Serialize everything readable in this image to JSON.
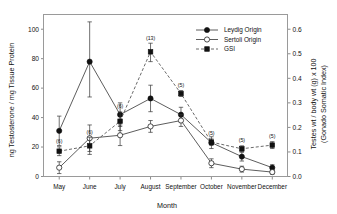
{
  "chart_data": {
    "type": "line",
    "title": "",
    "xlabel": "Month",
    "ylabel": "ng Testosterone / mg Tissue Protein",
    "y2label_line1": "Testes wt / body wt (g) x 100",
    "y2label_line2": "(Gonado Somatic Index)",
    "categories": [
      "May",
      "June",
      "July",
      "August",
      "September",
      "October",
      "November",
      "December"
    ],
    "ylim": [
      0,
      110
    ],
    "yticks": [
      0,
      20,
      40,
      60,
      80,
      100
    ],
    "ytick_labels": [
      "0",
      "20",
      "40",
      "60",
      "80",
      "100"
    ],
    "y2lim": [
      0.0,
      0.66
    ],
    "y2ticks": [
      0.0,
      0.1,
      0.2,
      0.3,
      0.4,
      0.5,
      0.6
    ],
    "y2tick_labels": [
      "0.0",
      "0.1",
      "0.2",
      "0.3",
      "0.4",
      "0.5",
      "0.6"
    ],
    "grid": false,
    "legend_position": "top-right",
    "series": [
      {
        "name": "Leydig Origin",
        "axis": "left",
        "marker": "filled-circle",
        "line": "solid",
        "values": [
          31,
          78,
          42,
          53,
          42,
          23,
          13.5,
          6
        ],
        "err_low": [
          10,
          24,
          8,
          9,
          5,
          4,
          3,
          2
        ],
        "err_high": [
          10,
          27,
          8,
          9,
          5,
          4,
          3,
          2
        ]
      },
      {
        "name": "Sertoli Origin",
        "axis": "left",
        "marker": "open-circle",
        "line": "solid",
        "values": [
          6,
          26,
          28,
          34,
          38,
          9,
          5,
          3
        ],
        "err_low": [
          4,
          9,
          7,
          4,
          4,
          3,
          2,
          1.5
        ],
        "err_high": [
          4,
          9,
          7,
          4,
          4,
          3,
          2,
          1.5
        ]
      },
      {
        "name": "GSI",
        "axis": "right",
        "marker": "filled-square",
        "line": "dashed",
        "values": [
          0.103,
          0.125,
          0.225,
          0.508,
          0.338,
          0.14,
          0.113,
          0.128
        ],
        "err_low": [
          0.018,
          0.035,
          0.038,
          0.04,
          0.012,
          0.013,
          0.012,
          0.014
        ],
        "err_high": [
          0.018,
          0.035,
          0.038,
          0.035,
          0.012,
          0.013,
          0.012,
          0.014
        ]
      }
    ],
    "annotations": [
      {
        "label": "(6)",
        "category": "May"
      },
      {
        "label": "(6)",
        "category": "June"
      },
      {
        "label": "(6)",
        "category": "July"
      },
      {
        "label": "(13)",
        "category": "August"
      },
      {
        "label": "(5)",
        "category": "September"
      },
      {
        "label": "(5)",
        "category": "October"
      },
      {
        "label": "(5)",
        "category": "November"
      },
      {
        "label": "(5)",
        "category": "December"
      }
    ],
    "legend_entries": [
      {
        "label": "Leydig Origin",
        "marker": "filled-circle",
        "line": "solid"
      },
      {
        "label": "Sertoli Origin",
        "marker": "open-circle",
        "line": "solid"
      },
      {
        "label": "GSI",
        "marker": "filled-square",
        "line": "dashed"
      }
    ],
    "colors": {
      "ink": "#111111",
      "frame": "#9a9a9a",
      "marker_open_fill": "#ffffff"
    }
  }
}
